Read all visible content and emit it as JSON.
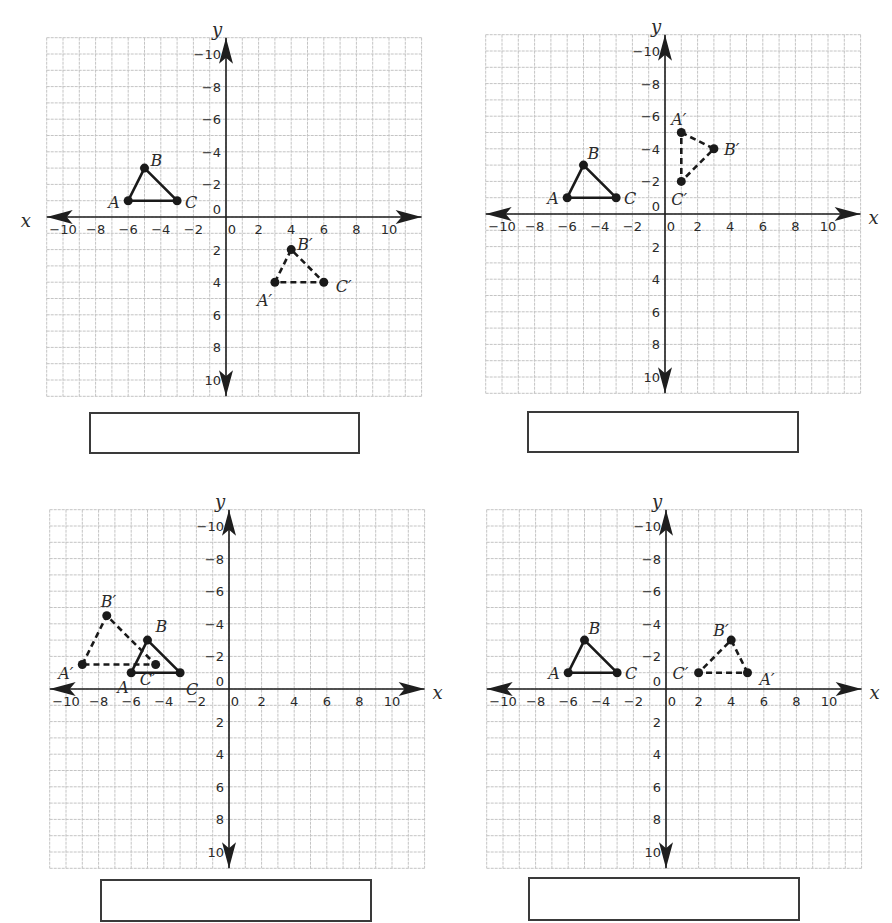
{
  "colors": {
    "grid": "#c4c4c4",
    "axis": "#1e1e1e",
    "figure": "#1a1a1a",
    "box_border": "#3a3a3a"
  },
  "common": {
    "x_axis_name": "x",
    "y_axis_name": "y",
    "x_tick_labels": [
      "−10",
      "−8",
      "−6",
      "−4",
      "−2",
      "0",
      "2",
      "4",
      "6",
      "8",
      "10"
    ],
    "y_tick_labels": [
      "10",
      "8",
      "6",
      "4",
      "2",
      "0",
      "−2",
      "−4",
      "−6",
      "−8",
      "−10"
    ]
  },
  "graphs": [
    {
      "id": "graph-1",
      "x_label_side": "left",
      "answer_box_value": ""
    },
    {
      "id": "graph-2",
      "x_label_side": "right",
      "answer_box_value": ""
    },
    {
      "id": "graph-3",
      "x_label_side": "right",
      "answer_box_value": ""
    },
    {
      "id": "graph-4",
      "x_label_side": "right",
      "answer_box_value": ""
    }
  ],
  "chart_data": [
    {
      "type": "scatter",
      "title": "",
      "xlabel": "x",
      "ylabel": "y",
      "xlim": [
        -11,
        12
      ],
      "ylim": [
        -11,
        11
      ],
      "grid": true,
      "x_ticks": [
        -10,
        -8,
        -6,
        -4,
        -2,
        0,
        2,
        4,
        6,
        8,
        10
      ],
      "y_ticks": [
        -10,
        -8,
        -6,
        -4,
        -2,
        0,
        2,
        4,
        6,
        8,
        10
      ],
      "series": [
        {
          "name": "Original triangle ABC",
          "style": "solid",
          "points": [
            {
              "label": "A",
              "x": -6,
              "y": 1
            },
            {
              "label": "B",
              "x": -5,
              "y": 3
            },
            {
              "label": "C",
              "x": -3,
              "y": 1
            }
          ]
        },
        {
          "name": "Image triangle A'B'C'",
          "style": "dashed",
          "points": [
            {
              "label": "A′",
              "x": 3,
              "y": -4
            },
            {
              "label": "B′",
              "x": 4,
              "y": -2
            },
            {
              "label": "C′",
              "x": 6,
              "y": -4
            }
          ]
        }
      ]
    },
    {
      "type": "scatter",
      "title": "",
      "xlabel": "x",
      "ylabel": "y",
      "xlim": [
        -11,
        12
      ],
      "ylim": [
        -11,
        11
      ],
      "grid": true,
      "x_ticks": [
        -10,
        -8,
        -6,
        -4,
        -2,
        0,
        2,
        4,
        6,
        8,
        10
      ],
      "y_ticks": [
        -10,
        -8,
        -6,
        -4,
        -2,
        0,
        2,
        4,
        6,
        8,
        10
      ],
      "series": [
        {
          "name": "Original triangle ABC",
          "style": "solid",
          "points": [
            {
              "label": "A",
              "x": -6,
              "y": 1
            },
            {
              "label": "B",
              "x": -5,
              "y": 3
            },
            {
              "label": "C",
              "x": -3,
              "y": 1
            }
          ]
        },
        {
          "name": "Image triangle A'B'C'",
          "style": "dashed",
          "points": [
            {
              "label": "A′",
              "x": 1,
              "y": 5
            },
            {
              "label": "B′",
              "x": 3,
              "y": 4
            },
            {
              "label": "C′",
              "x": 1,
              "y": 2
            }
          ]
        }
      ]
    },
    {
      "type": "scatter",
      "title": "",
      "xlabel": "x",
      "ylabel": "y",
      "xlim": [
        -11,
        12
      ],
      "ylim": [
        -11,
        11
      ],
      "grid": true,
      "x_ticks": [
        -10,
        -8,
        -6,
        -4,
        -2,
        0,
        2,
        4,
        6,
        8,
        10
      ],
      "y_ticks": [
        -10,
        -8,
        -6,
        -4,
        -2,
        0,
        2,
        4,
        6,
        8,
        10
      ],
      "series": [
        {
          "name": "Original triangle ABC",
          "style": "solid",
          "points": [
            {
              "label": "A",
              "x": -6,
              "y": 1
            },
            {
              "label": "B",
              "x": -5,
              "y": 3
            },
            {
              "label": "C",
              "x": -3,
              "y": 1
            }
          ]
        },
        {
          "name": "Image triangle A'B'C'",
          "style": "dashed",
          "points": [
            {
              "label": "A′",
              "x": -9,
              "y": 1.5
            },
            {
              "label": "B′",
              "x": -7.5,
              "y": 4.5
            },
            {
              "label": "C′",
              "x": -4.5,
              "y": 1.5
            }
          ]
        }
      ]
    },
    {
      "type": "scatter",
      "title": "",
      "xlabel": "x",
      "ylabel": "y",
      "xlim": [
        -11,
        12
      ],
      "ylim": [
        -11,
        11
      ],
      "grid": true,
      "x_ticks": [
        -10,
        -8,
        -6,
        -4,
        -2,
        0,
        2,
        4,
        6,
        8,
        10
      ],
      "y_ticks": [
        -10,
        -8,
        -6,
        -4,
        -2,
        0,
        2,
        4,
        6,
        8,
        10
      ],
      "series": [
        {
          "name": "Original triangle ABC",
          "style": "solid",
          "points": [
            {
              "label": "A",
              "x": -6,
              "y": 1
            },
            {
              "label": "B",
              "x": -5,
              "y": 3
            },
            {
              "label": "C",
              "x": -3,
              "y": 1
            }
          ]
        },
        {
          "name": "Image triangle A'B'C'",
          "style": "dashed",
          "points": [
            {
              "label": "A′",
              "x": 5,
              "y": 1
            },
            {
              "label": "B′",
              "x": 4,
              "y": 3
            },
            {
              "label": "C′",
              "x": 2,
              "y": 1
            }
          ]
        }
      ]
    }
  ]
}
